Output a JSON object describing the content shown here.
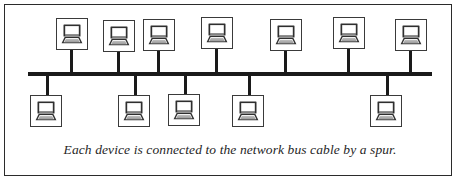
{
  "figure": {
    "caption": "Each device is connected to the network bus cable by a spur.",
    "frame": {
      "border_color": "#2b2b2b",
      "background_color": "#ffffff"
    }
  },
  "colors": {
    "line": "#1a1a1a",
    "node_border": "#3a3a3a",
    "node_fill": "#ffffff",
    "icon_dark": "#2f2f2f",
    "icon_screen": "#ffffff",
    "icon_shade": "#8c8c8c",
    "caption_text": "#1f1f1f"
  },
  "bus": {
    "label": "network-bus-cable",
    "x": 28,
    "y": 72,
    "width": 404,
    "thickness": 3.5
  },
  "counts": {
    "devices_total": 12,
    "devices_above_bus": 7,
    "devices_below_bus": 5
  },
  "devices_above": [
    {
      "name": "device-top-1",
      "icon": "computer-icon",
      "x": 56,
      "y": 18,
      "spur_x": 70,
      "spur_top": 50,
      "spur_height": 25
    },
    {
      "name": "device-top-2",
      "icon": "computer-icon",
      "x": 103,
      "y": 20,
      "spur_x": 117,
      "spur_top": 52,
      "spur_height": 23
    },
    {
      "name": "device-top-3",
      "icon": "computer-icon",
      "x": 143,
      "y": 19,
      "spur_x": 157,
      "spur_top": 51,
      "spur_height": 24
    },
    {
      "name": "device-top-4",
      "icon": "computer-icon",
      "x": 201,
      "y": 17,
      "spur_x": 215,
      "spur_top": 49,
      "spur_height": 26
    },
    {
      "name": "device-top-5",
      "icon": "computer-icon",
      "x": 270,
      "y": 19,
      "spur_x": 284,
      "spur_top": 51,
      "spur_height": 24
    },
    {
      "name": "device-top-6",
      "icon": "computer-icon",
      "x": 333,
      "y": 17,
      "spur_x": 347,
      "spur_top": 49,
      "spur_height": 26
    },
    {
      "name": "device-top-7",
      "icon": "computer-icon",
      "x": 395,
      "y": 19,
      "spur_x": 409,
      "spur_top": 51,
      "spur_height": 24
    }
  ],
  "devices_below": [
    {
      "name": "device-bottom-1",
      "icon": "computer-icon",
      "x": 30,
      "y": 95,
      "spur_x": 46,
      "spur_top": 74,
      "spur_height": 22
    },
    {
      "name": "device-bottom-2",
      "icon": "computer-icon",
      "x": 118,
      "y": 95,
      "spur_x": 134,
      "spur_top": 74,
      "spur_height": 22
    },
    {
      "name": "device-bottom-3",
      "icon": "computer-icon",
      "x": 168,
      "y": 94,
      "spur_x": 184,
      "spur_top": 74,
      "spur_height": 21
    },
    {
      "name": "device-bottom-4",
      "icon": "computer-icon",
      "x": 232,
      "y": 95,
      "spur_x": 248,
      "spur_top": 74,
      "spur_height": 22
    },
    {
      "name": "device-bottom-5",
      "icon": "computer-icon",
      "x": 370,
      "y": 95,
      "spur_x": 386,
      "spur_top": 74,
      "spur_height": 22
    }
  ]
}
